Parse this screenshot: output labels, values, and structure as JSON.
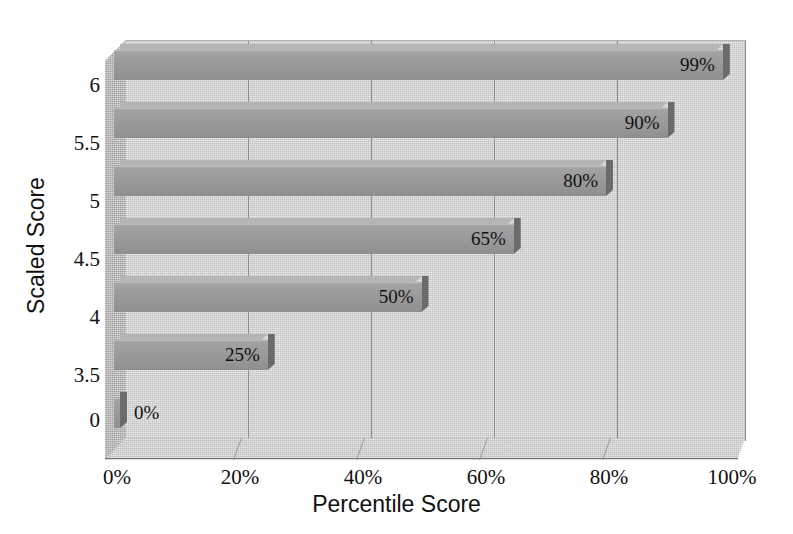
{
  "chart_data": {
    "type": "bar",
    "orientation": "horizontal",
    "style": "3d-grayscale",
    "title": "",
    "xlabel": "Percentile Score",
    "ylabel": "Scaled Score",
    "categories": [
      "6",
      "5.5",
      "5",
      "4.5",
      "4",
      "3.5",
      "0"
    ],
    "values": [
      99,
      90,
      80,
      65,
      50,
      25,
      0
    ],
    "value_labels": [
      "99%",
      "90%",
      "80%",
      "65%",
      "50%",
      "25%",
      "0%"
    ],
    "xlim": [
      0,
      100
    ],
    "xticks": [
      0,
      20,
      40,
      60,
      80,
      100
    ],
    "xtick_labels": [
      "0%",
      "20%",
      "40%",
      "60%",
      "80%",
      "100%"
    ],
    "ytick_labels": [
      "6",
      "5.5",
      "5",
      "4.5",
      "4",
      "3.5",
      "0"
    ],
    "grid": "vertical",
    "legend": "none",
    "colors": {
      "bar_face": "#9a9a9a",
      "bar_top": "#b5b5b5",
      "bar_cap": "#6b6b6b",
      "plot_background": "#cccccc",
      "side_wall": "#a6a6a6",
      "floor": "#c7c7c7",
      "gridline": "#8d8d8d",
      "text": "#111111",
      "page_background": "#ffffff"
    }
  },
  "axes": {
    "x_title": "Percentile Score",
    "y_title": "Scaled Score"
  }
}
